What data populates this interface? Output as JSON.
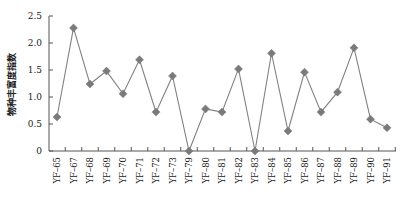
{
  "chart_data": {
    "type": "line",
    "title": "",
    "xlabel": "",
    "ylabel": "物种丰富度指数",
    "ylim": [
      0,
      2.5
    ],
    "yticks": [
      "0",
      "0.5",
      "1.0",
      "1.5",
      "2.0",
      "2.5"
    ],
    "yticks_values": [
      0,
      0.5,
      1.0,
      1.5,
      2.0,
      2.5
    ],
    "grid": false,
    "legend": null,
    "categories": [
      "YF–65",
      "YF–67",
      "YF–68",
      "YF–69",
      "YF–70",
      "YF–71",
      "YF–72",
      "YF–73",
      "YF–79",
      "YF–80",
      "YF–81",
      "YF–82",
      "YF–83",
      "YF–84",
      "YF–85",
      "YF–86",
      "YF–87",
      "YF–88",
      "YF–89",
      "YF–90",
      "YF–91"
    ],
    "series": [
      {
        "name": "物种丰富度指数",
        "marker": "diamond",
        "color": "#808080",
        "values": [
          0.63,
          2.28,
          1.24,
          1.48,
          1.06,
          1.69,
          0.72,
          1.39,
          0.0,
          0.78,
          0.72,
          1.52,
          0.0,
          1.81,
          0.37,
          1.46,
          0.72,
          1.09,
          1.91,
          0.59,
          0.43
        ]
      }
    ]
  },
  "colors": {
    "line": "#808080",
    "marker": "#7a7a7a",
    "axis": "#555555",
    "text": "#222222"
  }
}
